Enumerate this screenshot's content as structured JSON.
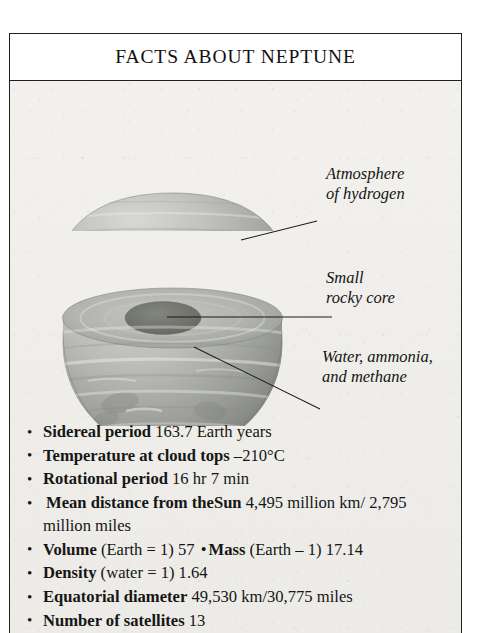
{
  "page": {
    "title": "FACTS ABOUT NEPTUNE"
  },
  "illustration": {
    "name": "neptune-cutaway-diagram",
    "description": "Cutaway sphere of Neptune with lifted upper hemisphere cap, lower bowl, and dark elliptical core",
    "callouts": [
      {
        "id": "atmosphere",
        "text": "Atmosphere\nof hydrogen"
      },
      {
        "id": "core",
        "text": "Small\nrocky core"
      },
      {
        "id": "mantle",
        "text": "Water, ammonia,\nand methane"
      }
    ]
  },
  "facts": [
    {
      "bullet": "•",
      "label": "Sidereal period",
      "value": " 163.7 Earth years"
    },
    {
      "bullet": "•",
      "label": "Temperature at cloud tops",
      "value": " –210°C"
    },
    {
      "bullet": "•",
      "label": "Rotational period",
      "value": " 16 hr 7 min"
    },
    {
      "bullet": "•",
      "label": "Mean distance from theSun",
      "value": " 4,495 million km/ 2,795 million miles"
    },
    {
      "bullet": "•",
      "label": "Volume",
      "value": " (Earth = 1) 57 ",
      "inline_bullet": "•",
      "label2": "Mass",
      "value2": " (Earth – 1) 17.14"
    },
    {
      "bullet": "•",
      "label": "Density",
      "value": " (water = 1) 1.64"
    },
    {
      "bullet": "•",
      "label": "Equatorial diameter",
      "value": " 49,530 km/30,775 miles"
    },
    {
      "bullet": "•",
      "label": "Number of satellites",
      "value": " 13"
    }
  ],
  "colors": {
    "frame": "#20201e",
    "paper": "#efeeea",
    "ink": "#161614",
    "planet_light": "#cfd0cd",
    "planet_mid": "#a9aaa6",
    "planet_dark": "#7e807c",
    "core_dark": "#6e706c"
  }
}
